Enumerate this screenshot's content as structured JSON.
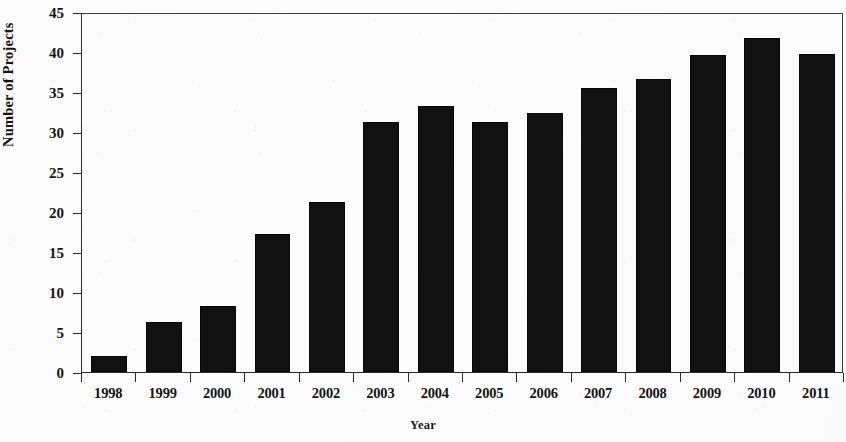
{
  "chart_data": {
    "type": "bar",
    "title": "",
    "xlabel": "Year",
    "ylabel": "Number of Projects",
    "categories": [
      "1998",
      "1999",
      "2000",
      "2001",
      "2002",
      "2003",
      "2004",
      "2005",
      "2006",
      "2007",
      "2008",
      "2009",
      "2010",
      "2011"
    ],
    "values": [
      2.0,
      6.2,
      8.2,
      17.2,
      21.2,
      31.2,
      33.3,
      31.3,
      32.4,
      35.5,
      36.6,
      39.6,
      41.7,
      39.7
    ],
    "ylim": [
      0,
      45
    ],
    "yticks": [
      0,
      5,
      10,
      15,
      20,
      25,
      30,
      35,
      40,
      45
    ],
    "ytick_labels": [
      "0",
      "5",
      "10",
      "15",
      "20",
      "25",
      "30",
      "35",
      "40",
      "45"
    ],
    "grid": false,
    "legend": null,
    "bar_color": "#111111",
    "background_color": "#fdfdfd",
    "axis_color": "#2b2b2b"
  }
}
